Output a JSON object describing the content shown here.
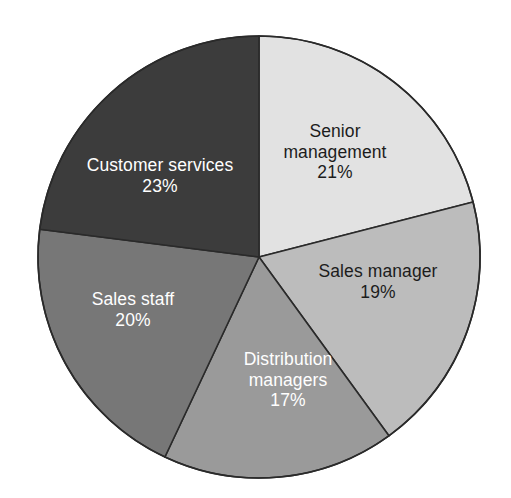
{
  "chart_data": {
    "type": "pie",
    "title": "",
    "subtitle": "",
    "xlabel": "",
    "ylabel": "",
    "legend_position": "none",
    "grid": false,
    "start_angle_deg": 0,
    "direction": "clockwise",
    "units": "percent",
    "total": 100,
    "categories": [
      "Senior management",
      "Sales manager",
      "Distribution managers",
      "Sales staff",
      "Customer services"
    ],
    "values": [
      21,
      19,
      17,
      20,
      23
    ],
    "slices": [
      {
        "name": "Senior management",
        "label_line1": "Senior",
        "label_line2": "management",
        "value": 21,
        "value_label": "21%",
        "color": "#e2e2e2",
        "text_color": "#1c1c1c",
        "start_deg": 0,
        "end_deg": 75.6,
        "label_x": 335,
        "label_y": 152
      },
      {
        "name": "Sales manager",
        "label_line1": "Sales manager",
        "label_line2": "",
        "value": 19,
        "value_label": "19%",
        "color": "#bcbcbc",
        "text_color": "#1c1c1c",
        "start_deg": 75.6,
        "end_deg": 144.0,
        "label_x": 378,
        "label_y": 282
      },
      {
        "name": "Distribution managers",
        "label_line1": "Distribution",
        "label_line2": "managers",
        "value": 17,
        "value_label": "17%",
        "color": "#9a9a9a",
        "text_color": "#ffffff",
        "start_deg": 144.0,
        "end_deg": 205.2,
        "label_x": 288,
        "label_y": 380
      },
      {
        "name": "Sales staff",
        "label_line1": "Sales staff",
        "label_line2": "",
        "value": 20,
        "value_label": "20%",
        "color": "#777777",
        "text_color": "#ffffff",
        "start_deg": 205.2,
        "end_deg": 277.2,
        "label_x": 133,
        "label_y": 310
      },
      {
        "name": "Customer services",
        "label_line1": "Customer services",
        "label_line2": "",
        "value": 23,
        "value_label": "23%",
        "color": "#3c3c3c",
        "text_color": "#ffffff",
        "start_deg": 277.2,
        "end_deg": 360.0,
        "label_x": 160,
        "label_y": 176
      }
    ],
    "geometry": {
      "center_x": 259,
      "center_y": 257,
      "radius": 221,
      "border_color": "#2a2a2a",
      "border_width": 1.6,
      "background": "#ffffff"
    }
  }
}
